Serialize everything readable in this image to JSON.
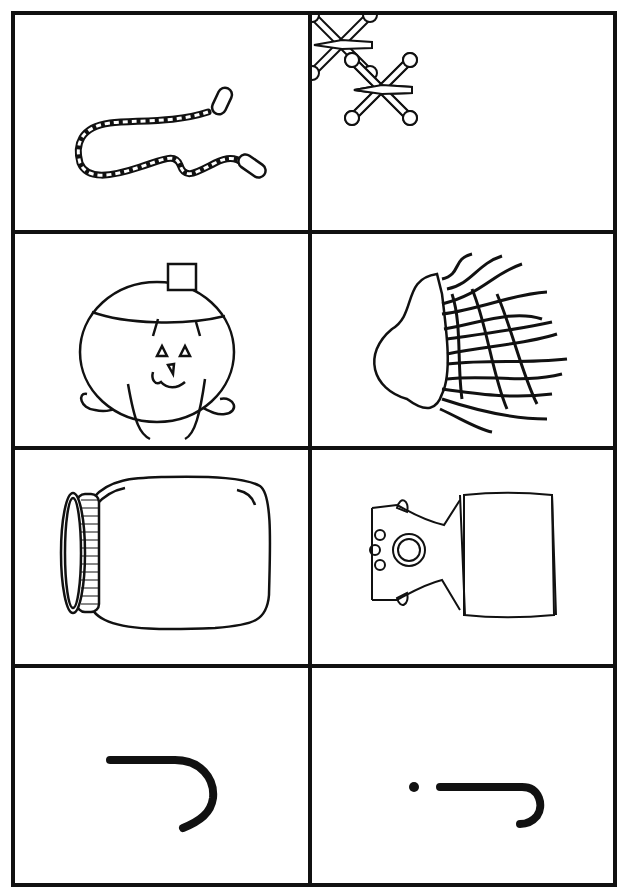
{
  "worksheet": {
    "layout": {
      "rows": 4,
      "columns": 2
    },
    "cells": [
      {
        "row": 1,
        "col": 1,
        "image": "jump-rope",
        "label": "jump rope"
      },
      {
        "row": 1,
        "col": 2,
        "image": "jacks",
        "label": "jacks"
      },
      {
        "row": 2,
        "col": 1,
        "image": "jack-o-lantern",
        "label": "jack-o'-lantern"
      },
      {
        "row": 2,
        "col": 2,
        "image": "jellyfish",
        "label": "jellyfish"
      },
      {
        "row": 3,
        "col": 1,
        "image": "jar",
        "label": "jar"
      },
      {
        "row": 3,
        "col": 2,
        "image": "jack-in-the-box",
        "label": "jack-in-the-box"
      },
      {
        "row": 4,
        "col": 1,
        "image": "letter-J-uppercase-rotated",
        "label": "J"
      },
      {
        "row": 4,
        "col": 2,
        "image": "letter-j-lowercase-rotated",
        "label": "j"
      }
    ],
    "colors": {
      "line": "#111111",
      "background": "#ffffff"
    }
  }
}
